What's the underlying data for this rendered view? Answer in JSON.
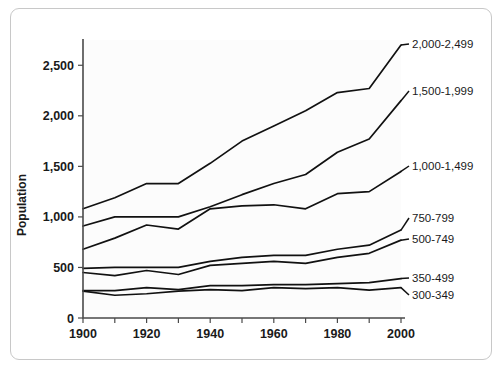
{
  "chart_data": {
    "type": "line",
    "title": "",
    "xlabel": "",
    "ylabel": "Population",
    "x": [
      1900,
      1910,
      1920,
      1930,
      1940,
      1950,
      1960,
      1970,
      1980,
      1990,
      2000
    ],
    "xlim": [
      1900,
      2000
    ],
    "ylim": [
      0,
      2750
    ],
    "xticks": [
      1900,
      1920,
      1940,
      1960,
      1980,
      2000
    ],
    "xtick_labels": [
      "1900",
      "1920",
      "1940",
      "1960",
      "1980",
      "2000"
    ],
    "xticks_minor": [
      1910,
      1930,
      1950,
      1970,
      1990
    ],
    "yticks": [
      0,
      500,
      1000,
      1500,
      2000,
      2500
    ],
    "ytick_labels": [
      "0",
      "500",
      "1,000",
      "1,500",
      "2,000",
      "2,500"
    ],
    "grid": false,
    "legend_position": "right-inline-labels",
    "series": [
      {
        "name": "2,000-2,499",
        "label": "2,000-2,499",
        "values": [
          1080,
          1190,
          1330,
          1330,
          1530,
          1750,
          1900,
          2050,
          2230,
          2270,
          2700
        ]
      },
      {
        "name": "1,500-1,999",
        "label": "1,500-1,999",
        "values": [
          910,
          1000,
          1000,
          1000,
          1100,
          1220,
          1330,
          1420,
          1640,
          1770,
          2150
        ]
      },
      {
        "name": "1,000-1,499",
        "label": "1,000-1,499",
        "values": [
          680,
          790,
          920,
          880,
          1080,
          1110,
          1120,
          1080,
          1230,
          1250,
          1450
        ]
      },
      {
        "name": "750-799",
        "label": "750-799",
        "values": [
          490,
          500,
          500,
          500,
          560,
          600,
          620,
          620,
          680,
          720,
          870
        ]
      },
      {
        "name": "500-749",
        "label": "500-749",
        "values": [
          450,
          420,
          470,
          430,
          520,
          540,
          560,
          540,
          600,
          640,
          770
        ]
      },
      {
        "name": "350-499",
        "label": "350-499",
        "values": [
          270,
          270,
          300,
          280,
          320,
          320,
          330,
          330,
          340,
          350,
          390
        ]
      },
      {
        "name": "300-349",
        "label": "300-349",
        "values": [
          265,
          225,
          240,
          265,
          280,
          270,
          300,
          290,
          300,
          275,
          300
        ]
      }
    ]
  },
  "colors": {
    "line": "#111111",
    "axis": "#4a4a4a",
    "frame": "#c8c8c8",
    "plot_bg": "#fcfcfc",
    "page_bg": "#ffffff"
  }
}
